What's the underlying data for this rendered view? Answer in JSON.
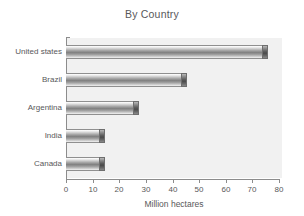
{
  "chart_data": {
    "type": "bar",
    "orientation": "horizontal",
    "title": "By Country",
    "xlabel": "Million hectares",
    "ylabel": "",
    "categories": [
      "United states",
      "Brazil",
      "Argentina",
      "India",
      "Canada"
    ],
    "values": [
      76,
      45.5,
      27.5,
      14.5,
      14.5
    ],
    "xlim": [
      0,
      80
    ],
    "xticks": [
      0,
      10,
      20,
      30,
      40,
      50,
      60,
      70,
      80
    ],
    "xticklabels": [
      "0",
      "10",
      "20",
      "30",
      "40",
      "50",
      "60",
      "70",
      "80"
    ],
    "grid": false,
    "legend": false,
    "series": [
      {
        "name": "Million hectares",
        "values": [
          76,
          45.5,
          27.5,
          14.5,
          14.5
        ]
      }
    ]
  },
  "style": {
    "plot_background": "#f1f1f1",
    "page_background": "#ffffff",
    "axis_color": "#8c8c8c",
    "text_color": "#58585a",
    "bar_mid_color": "#818181",
    "bar_cap_color": "#4a4a4a"
  }
}
